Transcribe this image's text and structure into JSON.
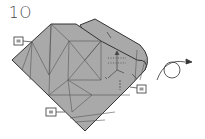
{
  "step": {
    "number": "1O"
  },
  "colors": {
    "paper": "#a9a9a9",
    "crease": "#555555",
    "outline": "#333333",
    "arrow": "#333333"
  },
  "references": [
    {
      "label": "9",
      "position": "upper-left"
    },
    {
      "label": "9",
      "position": "right"
    },
    {
      "label": "9",
      "position": "bottom-left"
    }
  ],
  "action": {
    "icon": "turn-over-arrow-icon",
    "meaning": "turn over"
  }
}
